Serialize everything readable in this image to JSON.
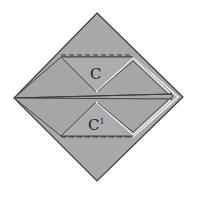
{
  "diagram": {
    "type": "origami-fold",
    "colors": {
      "background": "#ffffff",
      "paper": "#a9a9a9",
      "edge": "#3a3a3a",
      "highlight": "#f4f4f4"
    },
    "labels": {
      "upper_flap": "C",
      "lower_flap": "C",
      "lower_flap_superscript": "1"
    }
  }
}
